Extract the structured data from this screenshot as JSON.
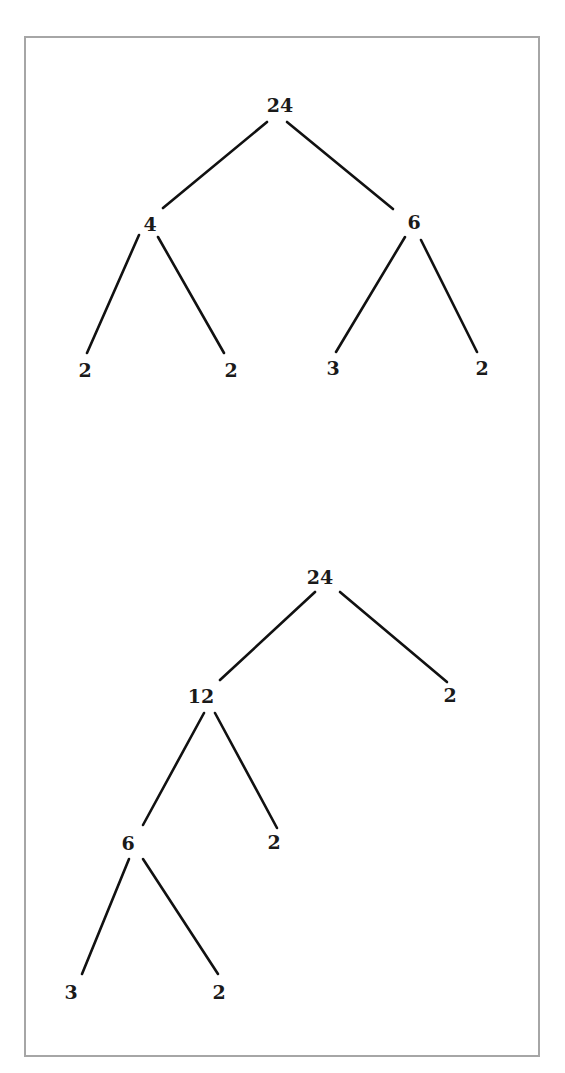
{
  "figure": {
    "border_color": "#a6a6a6",
    "line_color": "#111111",
    "trees": [
      {
        "name": "factor-tree-1",
        "nodes": [
          {
            "id": "t1-root",
            "label": "24",
            "x": 280,
            "y": 105
          },
          {
            "id": "t1-l",
            "label": "4",
            "x": 150,
            "y": 224
          },
          {
            "id": "t1-r",
            "label": "6",
            "x": 414,
            "y": 222
          },
          {
            "id": "t1-ll",
            "label": "2",
            "x": 85,
            "y": 370
          },
          {
            "id": "t1-lr",
            "label": "2",
            "x": 231,
            "y": 370
          },
          {
            "id": "t1-rl",
            "label": "3",
            "x": 333,
            "y": 368
          },
          {
            "id": "t1-rr",
            "label": "2",
            "x": 482,
            "y": 368
          }
        ],
        "edges": [
          {
            "from": "t1-root",
            "to": "t1-l",
            "x1": 267,
            "y1": 122,
            "x2": 163,
            "y2": 208
          },
          {
            "from": "t1-root",
            "to": "t1-r",
            "x1": 287,
            "y1": 122,
            "x2": 393,
            "y2": 209
          },
          {
            "from": "t1-l",
            "to": "t1-ll",
            "x1": 139,
            "y1": 235,
            "x2": 87,
            "y2": 353
          },
          {
            "from": "t1-l",
            "to": "t1-lr",
            "x1": 158,
            "y1": 237,
            "x2": 224,
            "y2": 353
          },
          {
            "from": "t1-r",
            "to": "t1-rl",
            "x1": 405,
            "y1": 237,
            "x2": 336,
            "y2": 352
          },
          {
            "from": "t1-r",
            "to": "t1-rr",
            "x1": 421,
            "y1": 240,
            "x2": 477,
            "y2": 352
          }
        ]
      },
      {
        "name": "factor-tree-2",
        "nodes": [
          {
            "id": "t2-root",
            "label": "24",
            "x": 320,
            "y": 577
          },
          {
            "id": "t2-l",
            "label": "12",
            "x": 201,
            "y": 696
          },
          {
            "id": "t2-r",
            "label": "2",
            "x": 450,
            "y": 695
          },
          {
            "id": "t2-ll",
            "label": "6",
            "x": 128,
            "y": 843
          },
          {
            "id": "t2-lr",
            "label": "2",
            "x": 274,
            "y": 842
          },
          {
            "id": "t2-lll",
            "label": "3",
            "x": 71,
            "y": 992
          },
          {
            "id": "t2-llr",
            "label": "2",
            "x": 219,
            "y": 992
          }
        ],
        "edges": [
          {
            "from": "t2-root",
            "to": "t2-l",
            "x1": 315,
            "y1": 592,
            "x2": 220,
            "y2": 680
          },
          {
            "from": "t2-root",
            "to": "t2-r",
            "x1": 340,
            "y1": 592,
            "x2": 447,
            "y2": 682
          },
          {
            "from": "t2-l",
            "to": "t2-ll",
            "x1": 204,
            "y1": 713,
            "x2": 143,
            "y2": 825
          },
          {
            "from": "t2-l",
            "to": "t2-lr",
            "x1": 215,
            "y1": 713,
            "x2": 277,
            "y2": 828
          },
          {
            "from": "t2-ll",
            "to": "t2-lll",
            "x1": 129,
            "y1": 859,
            "x2": 82,
            "y2": 974
          },
          {
            "from": "t2-ll",
            "to": "t2-llr",
            "x1": 143,
            "y1": 859,
            "x2": 218,
            "y2": 974
          }
        ]
      }
    ]
  }
}
